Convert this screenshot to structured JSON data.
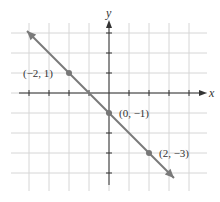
{
  "chart_data": {
    "type": "line",
    "title": "",
    "xlabel": "x",
    "ylabel": "y",
    "xlim": [
      -4,
      4
    ],
    "ylim": [
      -4,
      3
    ],
    "grid": true,
    "line": {
      "slope": -1,
      "intercept": -1,
      "equation": "y = -x - 1",
      "x_range": [
        -4,
        3.3
      ]
    },
    "points": [
      {
        "x": -2,
        "y": 1,
        "label": "(−2, 1)"
      },
      {
        "x": 0,
        "y": -1,
        "label": "(0, −1)"
      },
      {
        "x": 2,
        "y": -3,
        "label": "(2, −3)"
      }
    ],
    "colors": {
      "line": "#7a7a7a",
      "grid": "#d6d6d6",
      "axis": "#333333",
      "point": "#777777"
    }
  }
}
